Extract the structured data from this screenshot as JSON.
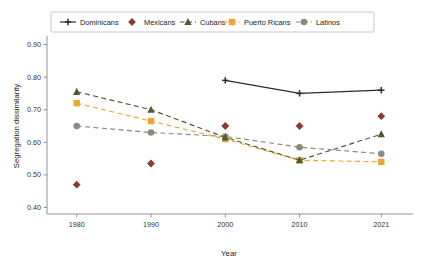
{
  "chart_data": {
    "type": "line",
    "title": "",
    "xlabel": "Year",
    "ylabel": "Segregation dissimilarity",
    "x": [
      1980,
      1990,
      2000,
      2010,
      2021
    ],
    "xtick_labels": [
      "1980",
      "1990",
      "2000",
      "2010",
      "2021"
    ],
    "ytick_labels": [
      "0.40",
      "0.50",
      "0.60",
      "0.70",
      "0.80",
      "0.90"
    ],
    "ytick_values": [
      0.4,
      0.5,
      0.6,
      0.7,
      0.8,
      0.9
    ],
    "ylim": [
      0.38,
      0.92
    ],
    "xlim": [
      1976,
      2025
    ],
    "grid": false,
    "legend_position": "top-center",
    "series": [
      {
        "name": "Dominicans",
        "color": "#2b2b2b",
        "marker": "plus",
        "dash": "solid",
        "x": [
          2000,
          2010,
          2021
        ],
        "values": [
          0.79,
          0.75,
          0.76
        ]
      },
      {
        "name": "Mexicans",
        "color": "#8e3a2c",
        "marker": "diamond",
        "dash": "none",
        "x": [
          1980,
          1990,
          2000,
          2010,
          2021
        ],
        "values": [
          0.47,
          0.535,
          0.65,
          0.65,
          0.68
        ]
      },
      {
        "name": "Cubans",
        "color": "#4e5b33",
        "marker": "triangle",
        "dash": "dashed",
        "x": [
          1980,
          1990,
          2000,
          2010,
          2021
        ],
        "values": [
          0.755,
          0.7,
          0.615,
          0.545,
          0.625
        ]
      },
      {
        "name": "Puerto Ricans",
        "color": "#f0a732",
        "marker": "square",
        "dash": "dashed",
        "x": [
          1980,
          1990,
          2000,
          2010,
          2021
        ],
        "values": [
          0.72,
          0.665,
          0.61,
          0.545,
          0.54
        ]
      },
      {
        "name": "Latinos",
        "color": "#8a8a7d",
        "marker": "circle",
        "dash": "dashed",
        "x": [
          1980,
          1990,
          2000,
          2010,
          2021
        ],
        "values": [
          0.65,
          0.63,
          0.618,
          0.585,
          0.565
        ]
      }
    ]
  },
  "legend": {
    "entries": [
      {
        "label": "Dominicans"
      },
      {
        "label": "Mexicans"
      },
      {
        "label": "Cubans"
      },
      {
        "label": "Puerto Ricans"
      },
      {
        "label": "Latinos"
      }
    ]
  }
}
